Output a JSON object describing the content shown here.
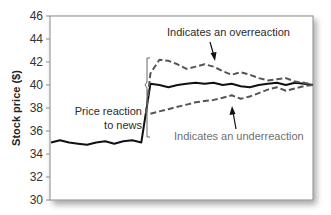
{
  "chart_data": {
    "type": "line",
    "title": "",
    "xlabel": "",
    "ylabel": "Stock price ($)",
    "ylim": [
      30,
      46
    ],
    "yticks": [
      30,
      32,
      34,
      36,
      38,
      40,
      42,
      44,
      46
    ],
    "grid": false,
    "legend": null,
    "x": [
      0,
      1,
      2,
      3,
      4,
      5,
      6,
      7,
      8,
      9,
      10,
      11,
      12,
      13,
      14,
      15,
      16,
      17,
      18,
      19,
      20,
      21,
      22,
      23,
      24,
      25,
      26,
      27,
      28,
      29,
      30
    ],
    "series": [
      {
        "name": "Actual price (efficient reaction)",
        "style": "solid",
        "color": "#111111",
        "points": [
          [
            0,
            35.0
          ],
          [
            1,
            35.2
          ],
          [
            2,
            35.0
          ],
          [
            3,
            34.9
          ],
          [
            4,
            34.8
          ],
          [
            5,
            35.0
          ],
          [
            6,
            35.1
          ],
          [
            7,
            34.9
          ],
          [
            8,
            35.1
          ],
          [
            9,
            35.2
          ],
          [
            10,
            35.0
          ],
          [
            11,
            40.1
          ],
          [
            12,
            40.0
          ],
          [
            13,
            39.8
          ],
          [
            14,
            40.0
          ],
          [
            15,
            40.1
          ],
          [
            16,
            40.2
          ],
          [
            17,
            40.1
          ],
          [
            18,
            40.2
          ],
          [
            19,
            40.0
          ],
          [
            20,
            40.1
          ],
          [
            21,
            39.9
          ],
          [
            22,
            39.8
          ],
          [
            23,
            40.0
          ],
          [
            24,
            40.1
          ],
          [
            25,
            40.2
          ],
          [
            26,
            40.0
          ],
          [
            27,
            40.2
          ],
          [
            28,
            40.1
          ],
          [
            29,
            40.0
          ]
        ]
      },
      {
        "name": "Overreaction",
        "style": "dashed",
        "color": "#555555",
        "points": [
          [
            10.5,
            37.5
          ],
          [
            11,
            41.0
          ],
          [
            12,
            42.2
          ],
          [
            13,
            42.1
          ],
          [
            14,
            41.8
          ],
          [
            15,
            41.4
          ],
          [
            16,
            41.6
          ],
          [
            17,
            41.8
          ],
          [
            18,
            41.6
          ],
          [
            19,
            41.2
          ],
          [
            20,
            40.9
          ],
          [
            21,
            41.1
          ],
          [
            22,
            40.9
          ],
          [
            23,
            40.6
          ],
          [
            24,
            40.4
          ],
          [
            25,
            40.5
          ],
          [
            26,
            40.6
          ],
          [
            27,
            40.3
          ],
          [
            28,
            40.2
          ],
          [
            29,
            40.0
          ]
        ]
      },
      {
        "name": "Underreaction",
        "style": "dashed",
        "color": "#555555",
        "points": [
          [
            11,
            37.5
          ],
          [
            12,
            37.7
          ],
          [
            13,
            37.9
          ],
          [
            14,
            38.1
          ],
          [
            15,
            38.3
          ],
          [
            16,
            38.5
          ],
          [
            17,
            38.6
          ],
          [
            18,
            38.7
          ],
          [
            19,
            38.9
          ],
          [
            20,
            39.1
          ],
          [
            21,
            38.8
          ],
          [
            22,
            39.0
          ],
          [
            23,
            39.3
          ],
          [
            24,
            39.6
          ],
          [
            25,
            39.8
          ],
          [
            26,
            39.5
          ],
          [
            27,
            39.7
          ],
          [
            28,
            39.9
          ],
          [
            29,
            40.0
          ]
        ]
      }
    ],
    "annotations": [
      {
        "text": "Indicates an overreaction",
        "points_to": "Overreaction"
      },
      {
        "text": "Indicates an underreaction",
        "points_to": "Underreaction"
      },
      {
        "text": "Price reaction to news",
        "brace": [
          35.0,
          40.0
        ]
      }
    ]
  },
  "labels": {
    "ylabel": "Stock price ($)",
    "yticks": [
      "30",
      "32",
      "34",
      "36",
      "38",
      "40",
      "42",
      "44",
      "46"
    ],
    "over": "Indicates an overreaction",
    "under": "Indicates an underreaction",
    "reaction_line1": "Price reaction",
    "reaction_line2": "to news"
  }
}
